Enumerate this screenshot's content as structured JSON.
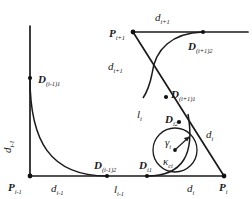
{
  "figure": {
    "type": "geometric-diagram",
    "background_color": "#ffffff",
    "stroke_color": "#1a1a1a",
    "marker_color": "#111111"
  },
  "vertices": [
    {
      "id": "P_im1",
      "label_base": "P",
      "label_sub": "i-1",
      "x": 30,
      "y": 176
    },
    {
      "id": "P_i",
      "label_base": "P",
      "label_sub": "i",
      "x": 224,
      "y": 176
    },
    {
      "id": "P_ip1",
      "label_base": "P",
      "label_sub": "i+1",
      "x": 133,
      "y": 32
    }
  ],
  "control_points": [
    {
      "id": "D_im1_1",
      "label_base": "D",
      "label_sub": "(i-1)1",
      "x": 30,
      "y": 78
    },
    {
      "id": "D_im1_2",
      "label_base": "D",
      "label_sub": "(i-1)2",
      "x": 107,
      "y": 176
    },
    {
      "id": "D_i1",
      "label_base": "D",
      "label_sub": "i1",
      "x": 147,
      "y": 176
    },
    {
      "id": "D_i2",
      "label_base": "D",
      "label_sub": "i2",
      "x": 178,
      "y": 122
    },
    {
      "id": "D_ip1_1",
      "label_base": "D",
      "label_sub": "(i+1)1",
      "x": 166,
      "y": 97
    },
    {
      "id": "D_ip1_2",
      "label_base": "D",
      "label_sub": "(i+1)2",
      "x": 203,
      "y": 32
    }
  ],
  "labels": [
    {
      "id": "lbl-P-im1",
      "base": "P",
      "sub": "i-1",
      "bold": true,
      "x": 10,
      "y": 180
    },
    {
      "id": "lbl-P-i",
      "base": "P",
      "sub": "i",
      "bold": true,
      "x": 221,
      "y": 180
    },
    {
      "id": "lbl-P-ip1",
      "base": "P",
      "sub": "i+1",
      "bold": true,
      "x": 111,
      "y": 27
    },
    {
      "id": "lbl-D-im1-1",
      "base": "D",
      "sub": "(i-1)1",
      "bold": true,
      "x": 39,
      "y": 73
    },
    {
      "id": "lbl-D-im1-2",
      "base": "D",
      "sub": "(i-1)2",
      "bold": true,
      "x": 97,
      "y": 159
    },
    {
      "id": "lbl-D-i1",
      "base": "D",
      "sub": "i1",
      "bold": true,
      "x": 140,
      "y": 159
    },
    {
      "id": "lbl-D-i2",
      "base": "D",
      "sub": "i2",
      "bold": true,
      "x": 167,
      "y": 114
    },
    {
      "id": "lbl-D-ip1-1",
      "base": "D",
      "sub": "(i+1)1",
      "bold": true,
      "x": 172,
      "y": 89
    },
    {
      "id": "lbl-D-ip1-2",
      "base": "D",
      "sub": "(i+1)2",
      "bold": true,
      "x": 190,
      "y": 40
    },
    {
      "id": "lbl-d-im1-h",
      "base": "d",
      "sub": "i-1",
      "bold": false,
      "x": 53,
      "y": 181
    },
    {
      "id": "lbl-l-im1",
      "base": "l",
      "sub": "i-1",
      "bold": false,
      "x": 115,
      "y": 182
    },
    {
      "id": "lbl-d-i-h",
      "base": "d",
      "sub": "i",
      "bold": false,
      "x": 188,
      "y": 181
    },
    {
      "id": "lbl-d-ip1-h",
      "base": "d",
      "sub": "i+1",
      "bold": false,
      "x": 157,
      "y": 11
    },
    {
      "id": "lbl-d-ip1-d",
      "base": "d",
      "sub": "i+1",
      "bold": false,
      "x": 110,
      "y": 60
    },
    {
      "id": "lbl-l-i",
      "base": "l",
      "sub": "i",
      "bold": false,
      "x": 138,
      "y": 109
    },
    {
      "id": "lbl-d-i-d",
      "base": "d",
      "sub": "i",
      "bold": false,
      "x": 207,
      "y": 128
    },
    {
      "id": "lbl-gamma",
      "base": "γ",
      "sub": "i",
      "bold": false,
      "x": 166,
      "y": 137
    },
    {
      "id": "lbl-kappa",
      "base": "κ",
      "sub": "ci",
      "bold": false,
      "x": 164,
      "y": 154
    }
  ],
  "vertical_label": {
    "id": "lbl-d-im1-v",
    "base": "d",
    "sub": "i-1",
    "x": 14,
    "y": 137
  },
  "circle": {
    "id": "osculating-circle",
    "center_x": 175,
    "center_y": 150,
    "radius": 22,
    "center_dot": true,
    "radius_arrow_from": {
      "x": 175,
      "y": 150
    },
    "radius_arrow_to": {
      "x": 190,
      "y": 136
    }
  },
  "paths": {
    "axis_vertical": "M 30 26 L 30 176",
    "axis_horizontal": "M 30 176 L 224 176",
    "top_line": "M 133 32 L 248 32",
    "diagonal_main": "M 133 32 L 224 176",
    "curve_left": "M 30 78 C 30 140 52 176 107 176",
    "curve_right_corner": "M 147 176 C 186 176 193 150 186 108",
    "curve_top_loop": "M 203 32 C 175 34 160 48 157 68"
  }
}
